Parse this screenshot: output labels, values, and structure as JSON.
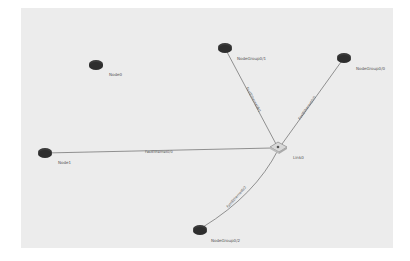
{
  "diagram": {
    "background": "#ececec",
    "nodes": [
      {
        "id": "node0",
        "label": "Node0",
        "x": 96,
        "y": 64,
        "type": "router"
      },
      {
        "id": "node1",
        "label": "Node1",
        "x": 45,
        "y": 153,
        "type": "router"
      },
      {
        "id": "ng01",
        "label": "NodeGroup0/1",
        "x": 225,
        "y": 48,
        "type": "router"
      },
      {
        "id": "ng00",
        "label": "NodeGroup0/0",
        "x": 344,
        "y": 58,
        "type": "router"
      },
      {
        "id": "ng02",
        "label": "NodeGroup0/2",
        "x": 200,
        "y": 230,
        "type": "router"
      },
      {
        "id": "link0",
        "label": "Link0",
        "x": 278,
        "y": 147,
        "type": "switch"
      }
    ],
    "edges": [
      {
        "from": "node1",
        "to": "link0",
        "label": "FastEthernet0/0"
      },
      {
        "from": "ng01",
        "to": "link0",
        "label": "FastEthernet0/1"
      },
      {
        "from": "ng00",
        "to": "link0",
        "label": "FastEthernet0/0"
      },
      {
        "from": "ng02",
        "to": "link0",
        "label": "FastEthernet0/2"
      }
    ]
  }
}
